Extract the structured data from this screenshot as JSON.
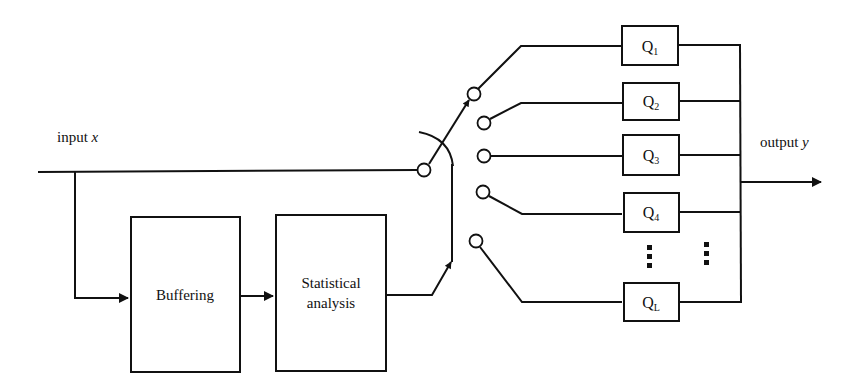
{
  "diagram": {
    "input_label": "input ",
    "input_var": "x",
    "output_label": "output ",
    "output_var": "y",
    "blocks": {
      "buffering": "Buffering",
      "statistical_line1": "Statistical",
      "statistical_line2": "analysis"
    },
    "quantizers": [
      {
        "base": "Q",
        "sub": "1"
      },
      {
        "base": "Q",
        "sub": "2"
      },
      {
        "base": "Q",
        "sub": "3"
      },
      {
        "base": "Q",
        "sub": "4"
      },
      {
        "base": "Q",
        "sub": "L"
      }
    ],
    "ellipsis": "⋮"
  }
}
